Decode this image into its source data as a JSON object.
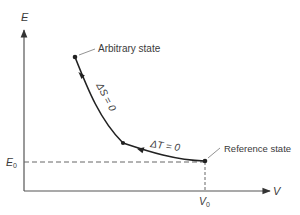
{
  "diagram": {
    "type": "thermodynamic state path (E vs V)",
    "axes": {
      "y_label": "E",
      "x_label": "V",
      "e0_label": "E",
      "e0_sub": "0",
      "v0_label": "V",
      "v0_sub": "0"
    },
    "points": {
      "arbitrary_state": "Arbitrary state",
      "reference_state": "Reference state"
    },
    "paths": {
      "adiabat": "ΔS = 0",
      "isotherm": "ΔT = 0"
    },
    "colors": {
      "line": "#222222",
      "axis": "#555555",
      "dashed": "#666666",
      "text": "#3a3a3a"
    }
  }
}
